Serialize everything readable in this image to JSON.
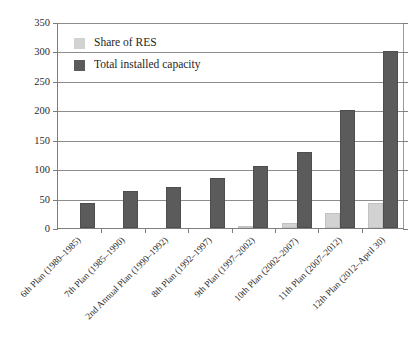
{
  "chart_data": {
    "type": "bar",
    "title": "",
    "subtitle": "",
    "xlabel": "",
    "ylabel": "",
    "ylim": [
      0,
      350
    ],
    "ytick_step": 50,
    "yticks": [
      "350",
      "300",
      "250",
      "200",
      "150",
      "100",
      "50",
      "0"
    ],
    "grid": true,
    "legend_position": "upper-left-inside",
    "categories": [
      "6th Plan (1980–1985)",
      "7th Plan (1985–1990)",
      "2nd Annual Plan (1990–1992)",
      "8th Plan (1992–1997)",
      "9th Plan (1997–2002)",
      "10th Plan (2002–2007)",
      "11th Plan (2007–2012)",
      "12th Plan (2012–April 30)"
    ],
    "series": [
      {
        "name": "Share of RES",
        "color": "#d2d2d2",
        "values": [
          0,
          0,
          0,
          0,
          2,
          9,
          25,
          43
        ]
      },
      {
        "name": "Total installed capacity",
        "color": "#5b5b5b",
        "values": [
          42,
          63,
          69,
          85,
          105,
          130,
          200,
          300
        ]
      }
    ]
  },
  "axis": {
    "ticks": [
      {
        "label": "350",
        "value": 350
      },
      {
        "label": "300",
        "value": 300
      },
      {
        "label": "250",
        "value": 250
      },
      {
        "label": "200",
        "value": 200
      },
      {
        "label": "150",
        "value": 150
      },
      {
        "label": "100",
        "value": 100
      },
      {
        "label": "50",
        "value": 50
      },
      {
        "label": "0",
        "value": 0
      }
    ]
  },
  "legend": {
    "entries": [
      {
        "label": "Share of RES",
        "color": "#d2d2d2"
      },
      {
        "label": "Total installed capacity",
        "color": "#5b5b5b"
      }
    ]
  }
}
